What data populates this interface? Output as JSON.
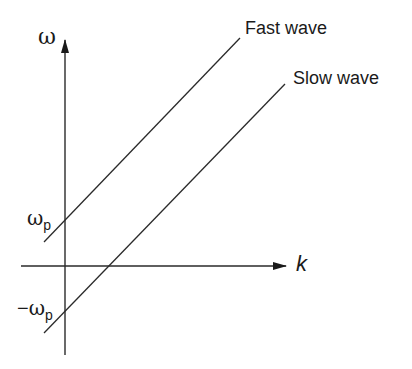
{
  "diagram": {
    "axes": {
      "y_label": "ω",
      "x_label": "k"
    },
    "ticks": {
      "omega_p": {
        "symbol": "ω",
        "subscript": "p"
      },
      "neg_omega_p": {
        "prefix": "−",
        "symbol": "ω",
        "subscript": "p"
      }
    },
    "curves": [
      {
        "name": "Fast wave",
        "intercept": "ω_p",
        "slope": "positive"
      },
      {
        "name": "Slow wave",
        "intercept": "−ω_p",
        "slope": "positive"
      }
    ],
    "colors": {
      "line": "#2a2a2a",
      "text": "#1a1a1a",
      "background": "#ffffff"
    }
  }
}
